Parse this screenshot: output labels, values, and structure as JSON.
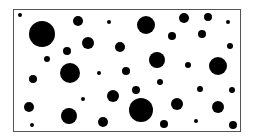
{
  "figure": {
    "type": "dot-pattern",
    "frame": {
      "x": 13,
      "y": 9,
      "width": 228,
      "height": 123,
      "stroke": "#555555"
    },
    "dot_color": "#000000",
    "dots": [
      {
        "cx": 20,
        "cy": 15,
        "r": 2
      },
      {
        "cx": 42,
        "cy": 34,
        "r": 13
      },
      {
        "cx": 78,
        "cy": 21,
        "r": 5
      },
      {
        "cx": 109,
        "cy": 22,
        "r": 2
      },
      {
        "cx": 146,
        "cy": 25,
        "r": 9
      },
      {
        "cx": 184,
        "cy": 18,
        "r": 5
      },
      {
        "cx": 208,
        "cy": 17,
        "r": 4
      },
      {
        "cx": 228,
        "cy": 22,
        "r": 2
      },
      {
        "cx": 88,
        "cy": 43,
        "r": 6
      },
      {
        "cx": 67,
        "cy": 51,
        "r": 4
      },
      {
        "cx": 47,
        "cy": 59,
        "r": 3
      },
      {
        "cx": 120,
        "cy": 47,
        "r": 5
      },
      {
        "cx": 172,
        "cy": 36,
        "r": 4
      },
      {
        "cx": 202,
        "cy": 34,
        "r": 4
      },
      {
        "cx": 230,
        "cy": 46,
        "r": 3
      },
      {
        "cx": 157,
        "cy": 60,
        "r": 8
      },
      {
        "cx": 70,
        "cy": 73,
        "r": 10
      },
      {
        "cx": 33,
        "cy": 79,
        "r": 4
      },
      {
        "cx": 99,
        "cy": 73,
        "r": 2
      },
      {
        "cx": 126,
        "cy": 71,
        "r": 4
      },
      {
        "cx": 188,
        "cy": 65,
        "r": 3
      },
      {
        "cx": 218,
        "cy": 66,
        "r": 9
      },
      {
        "cx": 160,
        "cy": 82,
        "r": 3
      },
      {
        "cx": 136,
        "cy": 90,
        "r": 4
      },
      {
        "cx": 200,
        "cy": 89,
        "r": 3
      },
      {
        "cx": 232,
        "cy": 90,
        "r": 3
      },
      {
        "cx": 113,
        "cy": 96,
        "r": 6
      },
      {
        "cx": 83,
        "cy": 99,
        "r": 2
      },
      {
        "cx": 29,
        "cy": 107,
        "r": 5
      },
      {
        "cx": 69,
        "cy": 116,
        "r": 8
      },
      {
        "cx": 141,
        "cy": 110,
        "r": 12
      },
      {
        "cx": 177,
        "cy": 104,
        "r": 6
      },
      {
        "cx": 218,
        "cy": 107,
        "r": 6
      },
      {
        "cx": 32,
        "cy": 125,
        "r": 2
      },
      {
        "cx": 103,
        "cy": 122,
        "r": 5
      },
      {
        "cx": 164,
        "cy": 124,
        "r": 4
      },
      {
        "cx": 196,
        "cy": 121,
        "r": 2
      },
      {
        "cx": 233,
        "cy": 125,
        "r": 4
      }
    ]
  }
}
